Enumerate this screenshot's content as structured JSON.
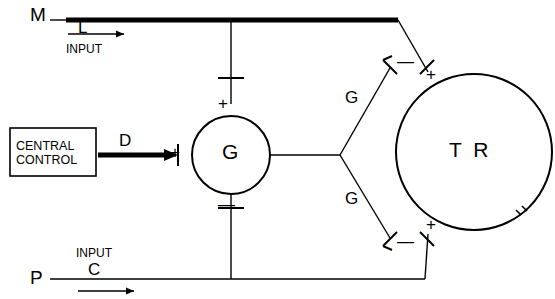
{
  "diagram": {
    "colors": {
      "line": "#000000",
      "background": "#ffffff"
    },
    "labels": {
      "m": "M",
      "l": "L",
      "input_top": "INPUT",
      "p": "P",
      "c": "C",
      "input_bottom": "INPUT",
      "d": "D",
      "g_center": "G",
      "g_upper": "G",
      "g_lower": "G",
      "tr": "T R",
      "central_control_line1": "CENTRAL",
      "central_control_line2": "CONTROL",
      "plus_g_top": "+",
      "minus_g_bottom": "—",
      "plus_g_left": "+",
      "minus_tr_upper": "—",
      "plus_tr_upper": "+",
      "minus_tr_lower": "—",
      "plus_tr_lower": "+"
    }
  }
}
